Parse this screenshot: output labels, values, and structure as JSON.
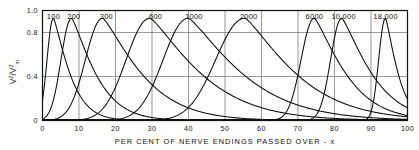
{
  "chart_data": {
    "type": "line",
    "title": "",
    "xlabel": "PER CENT OF NERVE ENDINGS PASSED OVER - x",
    "ylabel": "V2/V2m",
    "ylabel_parts": {
      "num_base": "V",
      "num_sup": "2",
      "den_base": "V",
      "den_sup": "2",
      "den_sub": "m"
    },
    "xlim": [
      0,
      100
    ],
    "ylim": [
      0,
      1.0
    ],
    "xticks": [
      0,
      10,
      20,
      30,
      40,
      50,
      60,
      70,
      80,
      90,
      100
    ],
    "xtick_labels": [
      "0",
      "10",
      "20",
      "30",
      "40",
      "50",
      "60",
      "70",
      "80",
      "90",
      "100"
    ],
    "yticks": [
      0,
      0.4,
      0.8,
      1.0
    ],
    "ytick_labels": [
      "0",
      "0.4",
      "0.8",
      "1.0"
    ],
    "grid": "vertical-and-horizontal",
    "legend_position": "inline-above-peaks",
    "series": [
      {
        "name": "100",
        "label": "100",
        "peak_x": 3.0,
        "peak_y": 0.93,
        "left_width": 2.4,
        "right_width": 5.5,
        "label_x": 3.0,
        "label_y": 0.985
      },
      {
        "name": "200",
        "label": "200",
        "peak_x": 8.0,
        "peak_y": 0.93,
        "left_width": 4.0,
        "right_width": 8.0,
        "label_x": 8.6,
        "label_y": 0.985
      },
      {
        "name": "300",
        "label": "300",
        "peak_x": 16.5,
        "peak_y": 0.93,
        "left_width": 6.5,
        "right_width": 13.0,
        "label_x": 17.5,
        "label_y": 0.985
      },
      {
        "name": "600",
        "label": "600",
        "peak_x": 29.5,
        "peak_y": 0.93,
        "left_width": 9.0,
        "right_width": 17.0,
        "label_x": 31.0,
        "label_y": 0.985
      },
      {
        "name": "1000",
        "label": "1000",
        "peak_x": 40.0,
        "peak_y": 0.93,
        "left_width": 9.5,
        "right_width": 18.0,
        "label_x": 41.5,
        "label_y": 0.985
      },
      {
        "name": "2000",
        "label": "2000",
        "peak_x": 55.5,
        "peak_y": 0.93,
        "left_width": 11.0,
        "right_width": 17.0,
        "label_x": 56.5,
        "label_y": 0.985
      },
      {
        "name": "6000",
        "label": "6000",
        "peak_x": 74.5,
        "peak_y": 0.93,
        "left_width": 5.0,
        "right_width": 10.5,
        "label_x": 74.5,
        "label_y": 0.985
      },
      {
        "name": "10000",
        "label": "10,000",
        "peak_x": 82.0,
        "peak_y": 0.93,
        "left_width": 4.2,
        "right_width": 10.0,
        "label_x": 82.5,
        "label_y": 0.985
      },
      {
        "name": "18000",
        "label": "18,000",
        "peak_x": 94.0,
        "peak_y": 0.93,
        "left_width": 2.6,
        "right_width": 4.2,
        "label_x": 94.0,
        "label_y": 0.985
      }
    ]
  }
}
